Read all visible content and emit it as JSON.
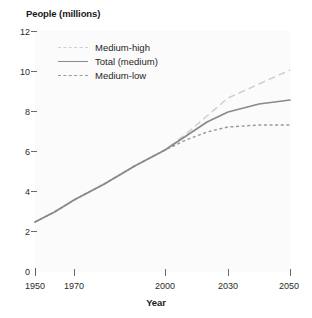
{
  "chart_data": {
    "type": "line",
    "title": "",
    "xlabel": "Year",
    "ylabel": "People (millions)",
    "xlim": [
      1950,
      2050
    ],
    "ylim": [
      0,
      12
    ],
    "grid": false,
    "legend_position": "upper-left-inside",
    "x_ticks": [
      1950,
      1970,
      2000,
      2030,
      2050
    ],
    "x_tick_labels": [
      "1950",
      "1970",
      "2000",
      "2030",
      "2050"
    ],
    "y_ticks": [
      0,
      2,
      4,
      6,
      8,
      10,
      12
    ],
    "y_tick_labels": [
      "0",
      "2",
      "4",
      "6",
      "8",
      "10",
      "12"
    ],
    "series": [
      {
        "name": "Medium-high",
        "style": "long-dash",
        "color": "#cfcfcf",
        "x": [
          1950,
          1960,
          1970,
          1980,
          1990,
          2000,
          2010,
          2020,
          2030,
          2040,
          2050
        ],
        "values": [
          2.5,
          3.0,
          3.6,
          4.4,
          5.3,
          6.1,
          6.9,
          7.8,
          8.7,
          9.4,
          10.1
        ]
      },
      {
        "name": "Total (medium)",
        "style": "solid",
        "color": "#8a8a8a",
        "x": [
          1950,
          1960,
          1970,
          1980,
          1990,
          2000,
          2010,
          2020,
          2030,
          2040,
          2050
        ],
        "values": [
          2.5,
          3.0,
          3.6,
          4.4,
          5.3,
          6.1,
          6.8,
          7.5,
          8.0,
          8.4,
          8.6
        ]
      },
      {
        "name": "Medium-low",
        "style": "short-dash",
        "color": "#9a9a9a",
        "x": [
          1950,
          1960,
          1970,
          1980,
          1990,
          2000,
          2010,
          2020,
          2030,
          2040,
          2050
        ],
        "values": [
          2.5,
          3.0,
          3.6,
          4.4,
          5.3,
          6.1,
          6.6,
          7.0,
          7.25,
          7.35,
          7.35
        ]
      }
    ]
  },
  "legend": {
    "items": [
      {
        "label": "Medium-high"
      },
      {
        "label": "Total (medium)"
      },
      {
        "label": "Medium-low"
      }
    ]
  },
  "axes": {
    "y_title": "People (millions)",
    "x_title": "Year"
  }
}
